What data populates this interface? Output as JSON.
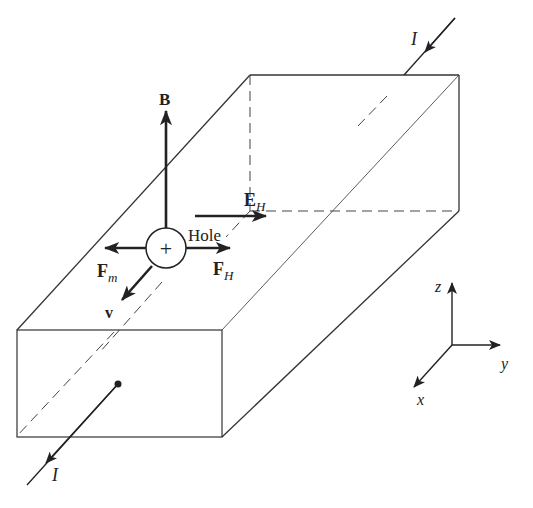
{
  "figure": {
    "labels": {
      "current_top": "I",
      "current_bottom": "I",
      "magnetic_field": "B",
      "hall_field_main": "E",
      "hall_field_sub": "H",
      "carrier": "Hole",
      "carrier_sign": "+",
      "magnetic_force_main": "F",
      "magnetic_force_sub": "m",
      "hall_force_main": "F",
      "hall_force_sub": "H",
      "velocity": "v"
    },
    "axes": {
      "z": "z",
      "y": "y",
      "x": "x"
    },
    "colors": {
      "line": "#222222",
      "background": "#ffffff"
    }
  }
}
